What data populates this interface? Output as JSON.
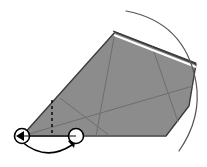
{
  "figure": {
    "canvas": {
      "width": 207,
      "height": 167,
      "background": "#ffffff"
    },
    "colors": {
      "fill": "#8c8c8c",
      "outline": "#3a3a3a",
      "internal_line": "#6e6e6e",
      "highlight_edge": "#ffffff",
      "marker_stroke": "#000000",
      "marker_fill": "#ffffff",
      "arrow": "#000000",
      "dashed_line": "#000000",
      "thin_arc": "#555555"
    },
    "pivots": [
      {
        "label": "left-pivot",
        "cx": 22,
        "cy": 136,
        "r": 7.5,
        "arrow_direction": "left"
      },
      {
        "label": "right-pivot",
        "cx": 76,
        "cy": 136,
        "r": 7.5,
        "arrow_direction": "up"
      }
    ],
    "rotation_arrow": {
      "label": "rotation-arrow",
      "from_x": 22,
      "from_y": 143,
      "to_x": 74,
      "to_y": 142,
      "sweep": "counterclockwise-below",
      "arrowhead_at": "right-pivot"
    },
    "dashed_line": {
      "label": "vertical-dashed-guide",
      "x": 52,
      "y_top": 100,
      "y_bottom": 136,
      "dash_pattern": "3 3"
    },
    "sector_polygon": {
      "label": "shaded-swept-sector",
      "points": "22,136 115,32 196,64 189,106 166,136 76,136"
    },
    "highlight_edge": {
      "label": "top-highlight-edge",
      "points": "114,34 196,66"
    },
    "internal_lines": [
      {
        "label": "fan-line-1",
        "x1": 22,
        "y1": 136,
        "x2": 193,
        "y2": 86
      },
      {
        "label": "fan-line-2",
        "x1": 22,
        "y1": 136,
        "x2": 166,
        "y2": 136
      },
      {
        "label": "crease-line-1",
        "x1": 115,
        "y1": 32,
        "x2": 96,
        "y2": 136
      },
      {
        "label": "crease-line-2",
        "x1": 60,
        "y1": 98,
        "x2": 110,
        "y2": 136
      },
      {
        "label": "crease-line-3",
        "x1": 152,
        "y1": 46,
        "x2": 178,
        "y2": 122
      }
    ],
    "thin_arc": {
      "label": "outer-construction-arc",
      "path": "M126,11 Q185,22 196,82 Q202,118 179,151"
    }
  }
}
